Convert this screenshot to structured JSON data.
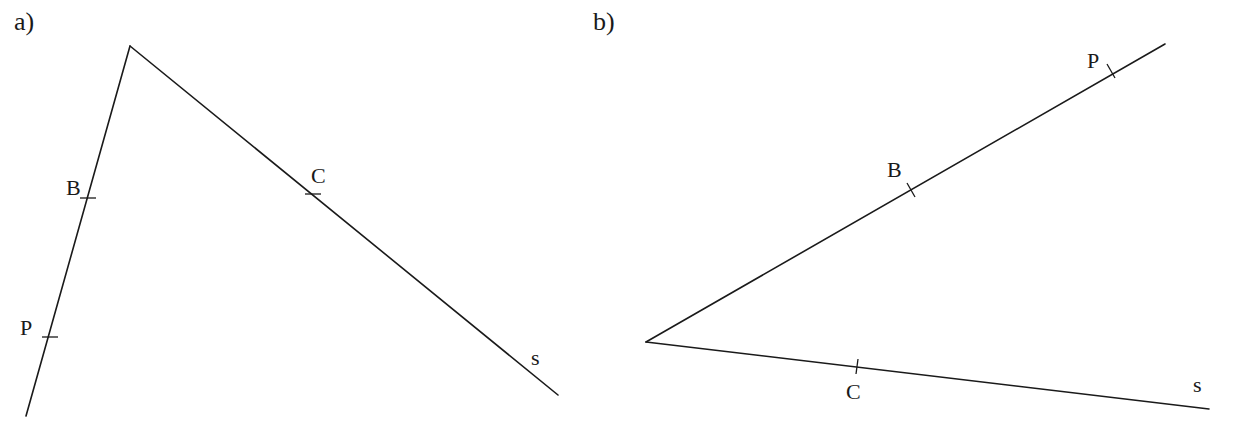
{
  "figure_a": {
    "label": "a)",
    "vertex": [
      130,
      46
    ],
    "ray1_end": [
      26,
      416
    ],
    "ray2_end": [
      558,
      395
    ],
    "points": {
      "B": {
        "label": "B",
        "at": [
          88,
          198
        ],
        "label_pos": [
          66,
          195
        ]
      },
      "P": {
        "label": "P",
        "at": [
          50,
          337
        ],
        "label_pos": [
          20,
          335
        ]
      },
      "C": {
        "label": "C",
        "at": [
          313,
          194
        ],
        "label_pos": [
          311,
          183
        ]
      },
      "s": {
        "label": "s",
        "label_pos": [
          531,
          365
        ]
      }
    }
  },
  "figure_b": {
    "label": "b)",
    "vertex": [
      646,
      342
    ],
    "ray1_end": [
      1165,
      44
    ],
    "ray2_end": [
      1209,
      409
    ],
    "points": {
      "P": {
        "label": "P",
        "at": [
          1111,
          71
        ],
        "label_pos": [
          1087,
          68
        ]
      },
      "B": {
        "label": "B",
        "at": [
          911,
          190
        ],
        "label_pos": [
          887,
          177
        ]
      },
      "C": {
        "label": "C",
        "at": [
          857,
          366
        ],
        "label_pos": [
          846,
          399
        ]
      },
      "s": {
        "label": "s",
        "label_pos": [
          1193,
          392
        ]
      }
    }
  }
}
